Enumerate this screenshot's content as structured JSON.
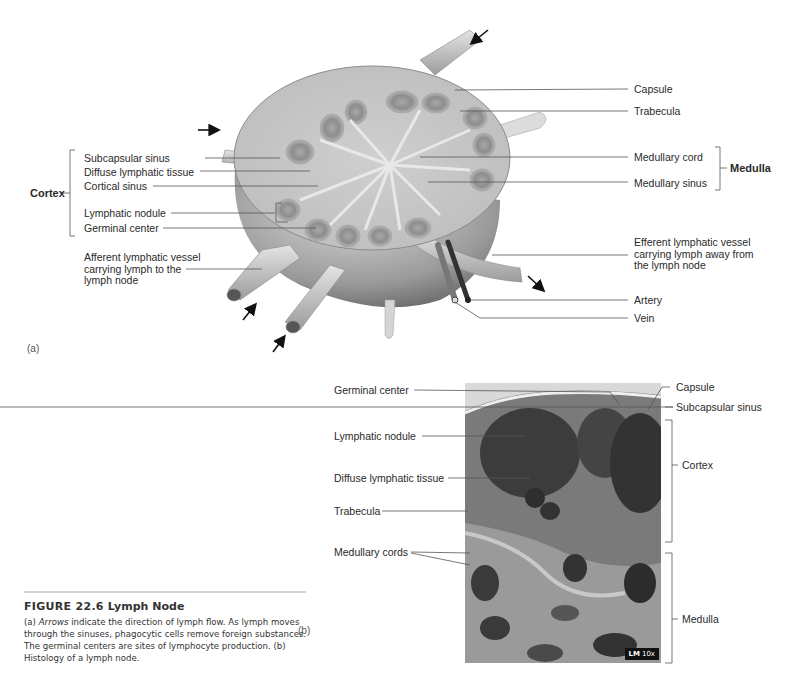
{
  "panel_a": {
    "tag": "(a)",
    "left_labels": {
      "cortex_group": "Cortex",
      "subcapsular_sinus": "Subcapsular sinus",
      "diffuse_lymphatic_tissue": "Diffuse lymphatic tissue",
      "cortical_sinus": "Cortical sinus",
      "lymphatic_nodule": "Lymphatic nodule",
      "germinal_center": "Germinal center",
      "afferent_vessel": "Afferent lymphatic vessel\ncarrying lymph to the\nlymph node"
    },
    "right_labels": {
      "capsule": "Capsule",
      "trabecula": "Trabecula",
      "medullary_cord": "Medullary cord",
      "medullary_sinus": "Medullary sinus",
      "medulla_group": "Medulla",
      "efferent_vessel": "Efferent lymphatic vessel\ncarrying lymph away from\nthe lymph node",
      "artery": "Artery",
      "vein": "Vein"
    }
  },
  "panel_b": {
    "tag": "(b)",
    "left_labels": {
      "germinal_center": "Germinal center",
      "lymphatic_nodule": "Lymphatic nodule",
      "diffuse_lymphatic_tissue": "Diffuse lymphatic tissue",
      "trabecula": "Trabecula",
      "medullary_cords": "Medullary cords"
    },
    "right_labels": {
      "capsule": "Capsule",
      "subcapsular_sinus": "Subcapsular sinus",
      "cortex": "Cortex",
      "medulla": "Medulla"
    },
    "badge": {
      "method": "LM",
      "magnification": "10x"
    }
  },
  "caption": {
    "figure_number": "FIGURE 22.6",
    "title": "Lymph Node",
    "part_a_marker": "(a)",
    "arrows_word": "Arrows",
    "text_1": " indicate the direction of lymph flow. As lymph moves through the sinuses, phagocytic cells remove foreign substances. The germinal centers are sites of lymphocyte production. ",
    "part_b_marker": "(b)",
    "text_2": " Histology of a lymph node."
  }
}
